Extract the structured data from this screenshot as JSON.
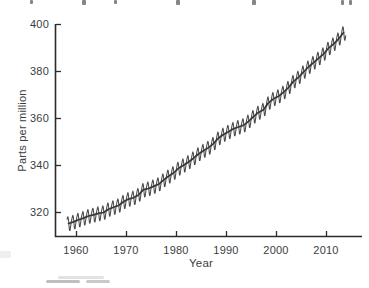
{
  "chart_data": {
    "type": "line",
    "title": "",
    "xlabel": "Year",
    "ylabel": "Parts per million",
    "xlim": [
      1956,
      2017
    ],
    "ylim": [
      310,
      400
    ],
    "xticks": [
      1960,
      1970,
      1980,
      1990,
      2000,
      2010
    ],
    "yticks": [
      320,
      340,
      360,
      380,
      400
    ],
    "xtick_labels": [
      "1960",
      "1970",
      "1980",
      "1990",
      "2000",
      "2010"
    ],
    "ytick_labels": [
      "400",
      "380",
      "360",
      "340",
      "320"
    ],
    "grid": false,
    "legend": false,
    "tick_direction": "inward",
    "series": [
      {
        "name": "Monthly CO2 concentration (seasonal cycle)",
        "style": "jagged line",
        "color": "#4a4a4a"
      },
      {
        "name": "Annual mean CO2 trend",
        "style": "smooth line",
        "color": "#363636"
      }
    ],
    "years": [
      1958,
      1959,
      1960,
      1961,
      1962,
      1963,
      1964,
      1965,
      1966,
      1967,
      1968,
      1969,
      1970,
      1971,
      1972,
      1973,
      1974,
      1975,
      1976,
      1977,
      1978,
      1979,
      1980,
      1981,
      1982,
      1983,
      1984,
      1985,
      1986,
      1987,
      1988,
      1989,
      1990,
      1991,
      1992,
      1993,
      1994,
      1995,
      1996,
      1997,
      1998,
      1999,
      2000,
      2001,
      2002,
      2003,
      2004,
      2005,
      2006,
      2007,
      2008,
      2009,
      2010,
      2011,
      2012,
      2013
    ],
    "annual_mean_ppm": [
      315.3,
      316.0,
      316.9,
      317.6,
      318.5,
      319.0,
      319.6,
      320.0,
      321.4,
      322.2,
      323.0,
      324.6,
      325.7,
      326.3,
      327.5,
      329.7,
      330.2,
      331.1,
      332.0,
      333.8,
      335.4,
      336.8,
      338.8,
      340.1,
      341.5,
      343.1,
      344.9,
      346.3,
      347.6,
      349.3,
      351.7,
      353.2,
      354.4,
      355.6,
      356.4,
      357.1,
      358.8,
      360.8,
      362.6,
      363.7,
      366.7,
      368.4,
      369.5,
      371.1,
      373.2,
      375.8,
      377.5,
      379.8,
      381.9,
      383.8,
      385.6,
      387.4,
      389.9,
      391.6,
      393.8,
      396.5
    ],
    "seasonal_cycle_ppm": [
      0.2,
      0.9,
      1.7,
      2.5,
      2.9,
      2.2,
      0.7,
      -1.4,
      -3.1,
      -3.2,
      -2.2,
      -1.1
    ],
    "colors": {
      "axis": "#2b2b2b",
      "tick_label": "#3d3d40",
      "seasonal_line": "#4a4a4a",
      "trend_line": "#363636"
    }
  }
}
